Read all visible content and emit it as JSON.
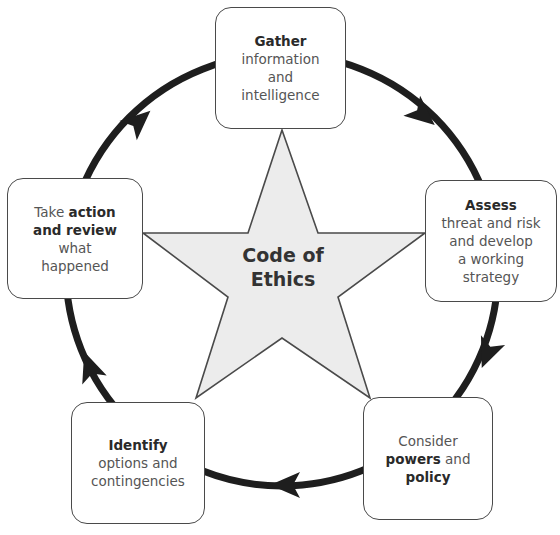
{
  "diagram": {
    "type": "cycle",
    "center": {
      "line1": "Code of",
      "line2": "Ethics"
    },
    "steps": [
      {
        "id": "gather",
        "lines": [
          {
            "parts": [
              {
                "text": "Gather",
                "bold": true
              }
            ]
          },
          {
            "parts": [
              {
                "text": "information",
                "bold": false
              }
            ]
          },
          {
            "parts": [
              {
                "text": "and",
                "bold": false
              }
            ]
          },
          {
            "parts": [
              {
                "text": "intelligence",
                "bold": false
              }
            ]
          }
        ]
      },
      {
        "id": "assess",
        "lines": [
          {
            "parts": [
              {
                "text": "Assess",
                "bold": true
              }
            ]
          },
          {
            "parts": [
              {
                "text": "threat and risk",
                "bold": false
              }
            ]
          },
          {
            "parts": [
              {
                "text": "and develop",
                "bold": false
              }
            ]
          },
          {
            "parts": [
              {
                "text": "a working",
                "bold": false
              }
            ]
          },
          {
            "parts": [
              {
                "text": "strategy",
                "bold": false
              }
            ]
          }
        ]
      },
      {
        "id": "consider",
        "lines": [
          {
            "parts": [
              {
                "text": "Consider",
                "bold": false
              }
            ]
          },
          {
            "parts": [
              {
                "text": "powers",
                "bold": true
              },
              {
                "text": " and",
                "bold": false
              }
            ]
          },
          {
            "parts": [
              {
                "text": "policy",
                "bold": true
              }
            ]
          }
        ]
      },
      {
        "id": "identify",
        "lines": [
          {
            "parts": [
              {
                "text": "Identify",
                "bold": true
              }
            ]
          },
          {
            "parts": [
              {
                "text": "options and",
                "bold": false
              }
            ]
          },
          {
            "parts": [
              {
                "text": "contingencies",
                "bold": false
              }
            ]
          }
        ]
      },
      {
        "id": "action",
        "lines": [
          {
            "parts": [
              {
                "text": "Take ",
                "bold": false
              },
              {
                "text": "action",
                "bold": true
              }
            ]
          },
          {
            "parts": [
              {
                "text": "and review",
                "bold": true
              }
            ]
          },
          {
            "parts": [
              {
                "text": "what",
                "bold": false
              }
            ]
          },
          {
            "parts": [
              {
                "text": "happened",
                "bold": false
              }
            ]
          }
        ]
      }
    ],
    "flow_direction": "clockwise",
    "colors": {
      "cycle_stroke": "#1e1e1e",
      "star_fill": "#ececec",
      "star_stroke": "#4a4a4a",
      "box_stroke": "#4a4a4a"
    }
  }
}
